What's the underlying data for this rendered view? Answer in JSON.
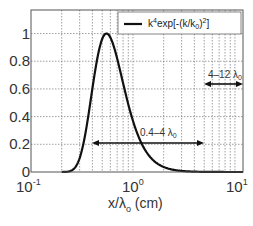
{
  "chart_data": {
    "type": "line",
    "title": "",
    "xlabel": "x/λo (cm)",
    "ylabel": "",
    "xscale": "log",
    "xlim": [
      0.1,
      12
    ],
    "ylim": [
      0,
      1.17
    ],
    "grid": true,
    "x_ticks": [
      "10^-1",
      "10^0",
      "10^1"
    ],
    "y_ticks": [
      "0",
      "0.2",
      "0.4",
      "0.6",
      "0.8",
      "1"
    ],
    "legend": {
      "position": "upper right",
      "entries": [
        "k^4exp[-(k/k0)^2]"
      ]
    },
    "series": [
      {
        "name": "k^4exp[-(k/k0)^2]",
        "x": [
          0.2,
          0.25,
          0.3,
          0.35,
          0.4,
          0.45,
          0.5,
          0.55,
          0.6,
          0.7,
          0.8,
          0.9,
          1.0,
          1.2,
          1.5,
          2.0,
          3.0,
          5.0,
          10.0,
          12.0
        ],
        "values": [
          0.0,
          0.03,
          0.2,
          0.47,
          0.72,
          0.9,
          0.98,
          1.0,
          0.98,
          0.88,
          0.74,
          0.6,
          0.49,
          0.31,
          0.15,
          0.05,
          0.01,
          0.0,
          0.0,
          0.0
        ]
      }
    ],
    "annotations": [
      {
        "text": "0.4–4 λo",
        "type": "double-arrow",
        "x_range": [
          0.4,
          4.2
        ],
        "y": 0.2
      },
      {
        "text": "4–12 λo",
        "type": "double-arrow",
        "x_range": [
          4.2,
          12
        ],
        "y": 0.63
      }
    ]
  },
  "labels": {
    "legend": "k",
    "legend_sup": "4",
    "legend_rest": "exp[-(k/k",
    "legend_sub": "0",
    "legend_end": ")",
    "legend_sup2": "2",
    "legend_close": "]",
    "xaxis_main": "x/λ",
    "xaxis_sub": "o",
    "xaxis_unit": " (cm)",
    "ann1": "0.4–4 λ",
    "ann1_sub": "0",
    "ann2": "4–12 λ",
    "ann2_sub": "0",
    "yticks": [
      "0",
      "0.2",
      "0.4",
      "0.6",
      "0.8",
      "1"
    ],
    "xtick_base": "10",
    "xtick_exps": [
      "-1",
      "0",
      "1"
    ]
  }
}
